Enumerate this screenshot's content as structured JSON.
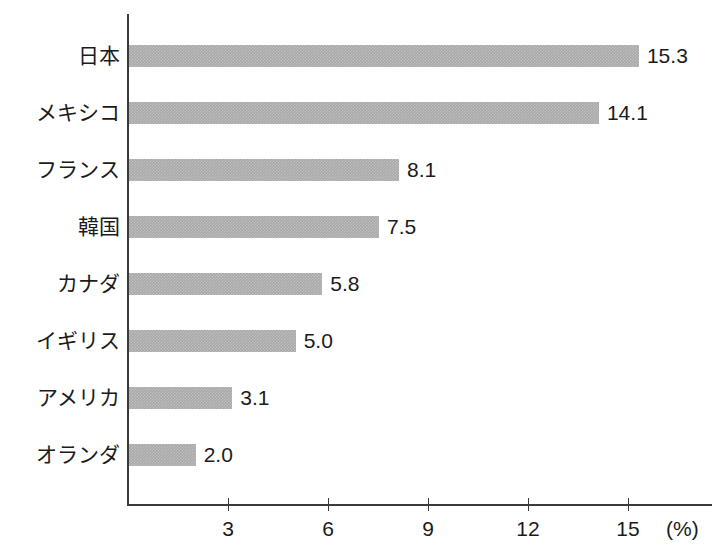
{
  "chart_data": {
    "type": "bar",
    "orientation": "horizontal",
    "title": "",
    "xlabel": "(%)",
    "ylabel": "",
    "categories": [
      "日本",
      "メキシコ",
      "フランス",
      "韓国",
      "カナダ",
      "イギリス",
      "アメリカ",
      "オランダ"
    ],
    "values": [
      15.3,
      14.1,
      8.1,
      7.5,
      5.8,
      5.0,
      3.1,
      2.0
    ],
    "value_labels": [
      "15.3",
      "14.1",
      "8.1",
      "7.5",
      "5.8",
      "5.0",
      "3.1",
      "2.0"
    ],
    "xlim": [
      0,
      17.5
    ],
    "xticks": [
      3,
      6,
      9,
      12,
      15
    ],
    "xtick_labels": [
      "3",
      "6",
      "9",
      "12",
      "15"
    ],
    "grid": false,
    "legend": false,
    "bar_color": "#a9a9a9",
    "axis_color": "#3a3a3a",
    "text_color": "#1b1b1b",
    "background": "#ffffff",
    "unit": "(%)"
  }
}
